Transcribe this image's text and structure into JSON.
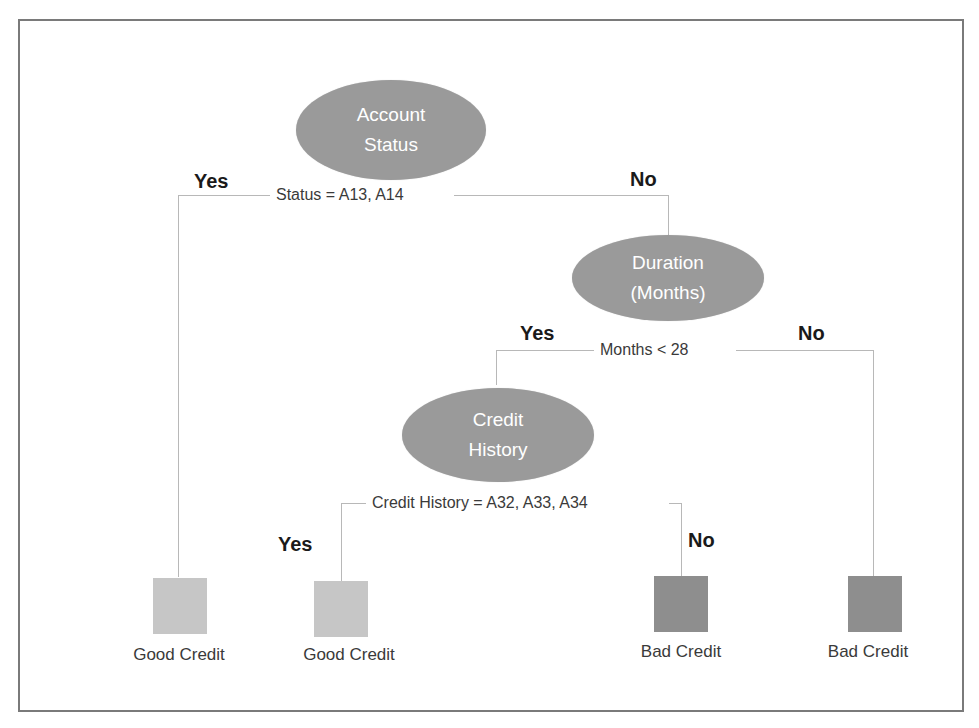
{
  "diagram": {
    "type": "decision-tree",
    "colors": {
      "decision_node": "#9a9a9a",
      "good_leaf": "#c6c6c6",
      "bad_leaf": "#8e8e8e",
      "connector": "#b8b8b8",
      "frame": "#7a7a7a"
    },
    "nodes": {
      "account_status": {
        "line1": "Account",
        "line2": "Status"
      },
      "duration": {
        "line1": "Duration",
        "line2": "(Months)"
      },
      "credit_history": {
        "line1": "Credit",
        "line2": "History"
      }
    },
    "conditions": {
      "status": "Status = A13, A14",
      "months": "Months < 28",
      "credit_history": "Credit History = A32, A33, A34"
    },
    "edges": {
      "status_yes": "Yes",
      "status_no": "No",
      "months_yes": "Yes",
      "months_no": "No",
      "history_yes": "Yes",
      "history_no": "No"
    },
    "leaves": [
      {
        "label": "Good Credit",
        "class": "good"
      },
      {
        "label": "Good Credit",
        "class": "good"
      },
      {
        "label": "Bad Credit",
        "class": "bad"
      },
      {
        "label": "Bad Credit",
        "class": "bad"
      }
    ]
  }
}
